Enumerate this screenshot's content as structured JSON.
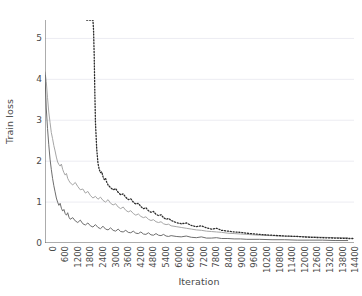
{
  "chart_data": {
    "type": "line",
    "title": "",
    "xlabel": "Iteration",
    "ylabel": "Train loss",
    "xlim": [
      0,
      14700
    ],
    "ylim": [
      0,
      5.45
    ],
    "grid": true,
    "grid_axis": "y",
    "legend": "none",
    "xticks": [
      0,
      600,
      1200,
      1800,
      2400,
      3000,
      3600,
      4200,
      4800,
      5400,
      6000,
      6600,
      7200,
      7800,
      8400,
      9000,
      9600,
      10200,
      10800,
      11400,
      12000,
      12600,
      13200,
      13800,
      14400
    ],
    "yticks": [
      0,
      1,
      2,
      3,
      4,
      5
    ],
    "colors": {
      "series_light": "#a6a6a6",
      "series_dark": "#6e6e6e",
      "series_dotted": "#2b2b2b",
      "axis": "#5a5a5a",
      "grid": "#ececf2",
      "background": "#ffffff"
    },
    "series": [
      {
        "name": "series-light-solid",
        "style": "solid",
        "color": "#a6a6a6",
        "width": 1.0,
        "x": [
          0,
          60,
          120,
          180,
          240,
          300,
          360,
          420,
          480,
          540,
          600,
          660,
          720,
          780,
          840,
          900,
          960,
          1020,
          1080,
          1140,
          1200,
          1320,
          1440,
          1560,
          1680,
          1800,
          1920,
          2040,
          2160,
          2280,
          2400,
          2520,
          2640,
          2760,
          2880,
          3000,
          3120,
          3240,
          3360,
          3480,
          3600,
          3720,
          3840,
          3960,
          4080,
          4200,
          4320,
          4440,
          4560,
          4680,
          4800,
          4920,
          5040,
          5160,
          5280,
          5400,
          5520,
          5640,
          5760,
          5880,
          6000,
          6240,
          6480,
          6720,
          6960,
          7200,
          7440,
          7680,
          7920,
          8160,
          8400,
          8700,
          9000,
          9300,
          9600,
          10200,
          10800,
          11400,
          12000,
          12600,
          13200,
          13800,
          14400
        ],
        "y": [
          4.18,
          3.95,
          3.55,
          3.2,
          2.95,
          2.7,
          2.55,
          2.38,
          2.25,
          2.1,
          1.98,
          1.92,
          1.88,
          1.93,
          1.8,
          1.72,
          1.66,
          1.7,
          1.58,
          1.52,
          1.47,
          1.42,
          1.48,
          1.38,
          1.3,
          1.32,
          1.22,
          1.26,
          1.16,
          1.1,
          1.14,
          1.07,
          1.12,
          1.04,
          1.0,
          1.06,
          0.97,
          0.93,
          0.96,
          0.88,
          0.84,
          0.88,
          0.8,
          0.76,
          0.79,
          0.72,
          0.68,
          0.71,
          0.65,
          0.62,
          0.64,
          0.58,
          0.55,
          0.57,
          0.52,
          0.5,
          0.52,
          0.47,
          0.45,
          0.46,
          0.42,
          0.4,
          0.38,
          0.36,
          0.34,
          0.32,
          0.31,
          0.29,
          0.28,
          0.27,
          0.26,
          0.24,
          0.23,
          0.22,
          0.21,
          0.19,
          0.18,
          0.17,
          0.16,
          0.15,
          0.14,
          0.13,
          0.13
        ]
      },
      {
        "name": "series-dark-solid",
        "style": "solid",
        "color": "#6e6e6e",
        "width": 1.0,
        "x": [
          0,
          60,
          120,
          180,
          240,
          300,
          360,
          420,
          480,
          540,
          600,
          660,
          720,
          780,
          840,
          900,
          960,
          1020,
          1080,
          1140,
          1200,
          1320,
          1440,
          1560,
          1680,
          1800,
          1920,
          2040,
          2160,
          2280,
          2400,
          2520,
          2640,
          2760,
          2880,
          3000,
          3120,
          3240,
          3360,
          3480,
          3600,
          3720,
          3840,
          3960,
          4080,
          4200,
          4320,
          4440,
          4560,
          4680,
          4800,
          4920,
          5040,
          5160,
          5280,
          5400,
          5520,
          5640,
          5760,
          5880,
          6000,
          6240,
          6480,
          6720,
          6960,
          7200,
          7440,
          7680,
          7920,
          8160,
          8400,
          8700,
          9000,
          9300,
          9600,
          10200,
          10800,
          11400,
          12000,
          12600,
          13200,
          13800,
          14400
        ],
        "y": [
          4.1,
          3.3,
          2.8,
          2.4,
          2.05,
          1.8,
          1.58,
          1.4,
          1.25,
          1.1,
          1.0,
          0.92,
          0.97,
          0.85,
          0.78,
          0.82,
          0.72,
          0.68,
          0.74,
          0.63,
          0.58,
          0.62,
          0.54,
          0.5,
          0.56,
          0.47,
          0.44,
          0.49,
          0.42,
          0.39,
          0.45,
          0.38,
          0.35,
          0.41,
          0.34,
          0.32,
          0.37,
          0.31,
          0.29,
          0.34,
          0.28,
          0.27,
          0.31,
          0.26,
          0.25,
          0.29,
          0.24,
          0.23,
          0.27,
          0.22,
          0.21,
          0.25,
          0.2,
          0.19,
          0.23,
          0.19,
          0.18,
          0.21,
          0.17,
          0.16,
          0.18,
          0.16,
          0.15,
          0.17,
          0.14,
          0.13,
          0.15,
          0.12,
          0.12,
          0.13,
          0.11,
          0.11,
          0.1,
          0.1,
          0.09,
          0.09,
          0.08,
          0.08,
          0.07,
          0.07,
          0.07,
          0.06,
          0.06
        ]
      },
      {
        "name": "series-dotted",
        "style": "dotted",
        "color": "#2b2b2b",
        "width": 1.3,
        "note": "clipped at top of axes; descends steeply after 2400",
        "x": [
          1980,
          1990,
          2000,
          2010,
          2020,
          2040,
          2060,
          2080,
          2100,
          2130,
          2160,
          2190,
          2220,
          2250,
          2280,
          2310,
          2340,
          2370,
          2400,
          2460,
          2520,
          2580,
          2640,
          2700,
          2760,
          2820,
          2880,
          2940,
          3000,
          3120,
          3240,
          3360,
          3480,
          3600,
          3720,
          3840,
          3960,
          4080,
          4200,
          4320,
          4440,
          4560,
          4680,
          4800,
          4920,
          5040,
          5160,
          5280,
          5400,
          5520,
          5640,
          5760,
          5880,
          6000,
          6240,
          6480,
          6720,
          6960,
          7200,
          7440,
          7680,
          7920,
          8160,
          8400,
          8700,
          9000,
          9300,
          9600,
          10200,
          10800,
          11400,
          12000,
          12600,
          13200,
          13800,
          14400,
          14700
        ],
        "y": [
          5.45,
          5.45,
          5.45,
          5.45,
          5.45,
          5.45,
          5.45,
          5.45,
          5.45,
          5.45,
          5.45,
          5.45,
          5.45,
          5.45,
          5.45,
          5.2,
          4.6,
          3.7,
          2.95,
          2.3,
          1.95,
          1.8,
          1.72,
          1.74,
          1.62,
          1.55,
          1.58,
          1.48,
          1.42,
          1.35,
          1.3,
          1.33,
          1.24,
          1.18,
          1.2,
          1.12,
          1.06,
          1.08,
          1.0,
          0.95,
          0.97,
          0.89,
          0.84,
          0.86,
          0.79,
          0.75,
          0.77,
          0.7,
          0.67,
          0.69,
          0.62,
          0.58,
          0.6,
          0.55,
          0.5,
          0.47,
          0.49,
          0.43,
          0.4,
          0.42,
          0.37,
          0.34,
          0.36,
          0.31,
          0.29,
          0.27,
          0.26,
          0.24,
          0.21,
          0.19,
          0.17,
          0.16,
          0.14,
          0.13,
          0.12,
          0.11,
          0.11
        ]
      }
    ]
  }
}
